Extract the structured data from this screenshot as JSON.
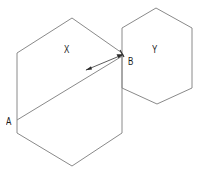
{
  "figure": {
    "background_color": "#ffffff",
    "stroke_color": "#8a8a8a",
    "label_color": "#1a1a1a",
    "arrow_color": "#333333",
    "labels": {
      "hexagon_left": "X",
      "hexagon_right": "Y",
      "point_a": "A",
      "point_b": "B"
    },
    "shapes": [
      {
        "name": "hexagon-left",
        "label": "X",
        "points": "17,53 72,18 122,53 122,133 72,166 17,133"
      },
      {
        "name": "hexagon-right",
        "label": "Y",
        "points": "122,28 156,8 192,28 192,88 157,104 122,88"
      }
    ],
    "segments": [
      {
        "name": "diagonal-a-to-b",
        "from_label": "A",
        "to_label": "B",
        "x1": 17,
        "y1": 120,
        "x2": 124,
        "y2": 55
      },
      {
        "name": "double-arrow",
        "x1": 85,
        "y1": 70,
        "x2": 123,
        "y2": 54
      }
    ]
  }
}
